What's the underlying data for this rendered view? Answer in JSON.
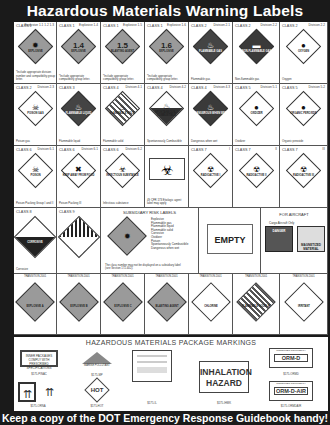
{
  "title": "Hazardous Materials Warning Labels",
  "footer": "Keep a copy of the DOT Emergency Response Guidebook handy!",
  "row1": [
    {
      "cls": "CLASS 1",
      "div": "Explosive 1.1 1.2 1.3",
      "num": "",
      "txt": "EXPLOSIVE",
      "sym": "✹",
      "style": "orange",
      "cap": "*Include appropriate division number and compatibility group letter."
    },
    {
      "cls": "CLASS 1",
      "div": "Explosive 1.4",
      "num": "1.4",
      "txt": "EXPLOSIVE",
      "sym": "",
      "style": "orange",
      "cap": "*Include appropriate compatibility group letter."
    },
    {
      "cls": "CLASS 1",
      "div": "Explosive 1.5",
      "num": "1.5",
      "txt": "BLASTING AGENT",
      "sym": "",
      "style": "orange",
      "cap": "*Include appropriate compatibility group letter."
    },
    {
      "cls": "CLASS 1",
      "div": "Explosive 1.6",
      "num": "1.6",
      "txt": "EXPLOSIVE",
      "sym": "",
      "style": "orange",
      "cap": "*Include appropriate compatibility group letter."
    },
    {
      "cls": "CLASS 2",
      "div": "Division 2.1",
      "num": "",
      "txt": "FLAMMABLE GAS",
      "sym": "♨",
      "style": "dark",
      "cap": "Flammable gas"
    },
    {
      "cls": "CLASS 2",
      "div": "Division 2.2",
      "num": "",
      "txt": "NON-FLAMMABLE GAS",
      "sym": "▬",
      "style": "darker",
      "cap": "Non-flammable gas"
    },
    {
      "cls": "CLASS 2",
      "div": "Division 2.2",
      "num": "",
      "txt": "OXYGEN",
      "sym": "●",
      "style": "white",
      "cap": "Oxygen"
    }
  ],
  "row2": [
    {
      "cls": "CLASS 2",
      "div": "Division 2.3",
      "num": "",
      "txt": "POISON GAS",
      "sym": "☠",
      "style": "white",
      "cap": "Poison gas"
    },
    {
      "cls": "CLASS 3",
      "div": "",
      "num": "",
      "txt": "FLAMMABLE LIQUID",
      "sym": "♨",
      "style": "dark",
      "cap": "Flammable liquid"
    },
    {
      "cls": "CLASS 4",
      "div": "Division 4.1",
      "num": "",
      "txt": "FLAMMABLE SOLID",
      "sym": "♨",
      "style": "stripe",
      "cap": "Flammable solid"
    },
    {
      "cls": "CLASS 4",
      "div": "Division 4.2",
      "num": "",
      "txt": "SPONTANEOUSLY COMBUSTIBLE",
      "sym": "♨",
      "style": "half",
      "cap": "Spontaneously Combustible"
    },
    {
      "cls": "CLASS 4",
      "div": "Division 4.3",
      "num": "",
      "txt": "DANGEROUS WHEN WET",
      "sym": "♨",
      "style": "darker",
      "cap": "Dangerous when wet"
    },
    {
      "cls": "CLASS 5",
      "div": "Division 5.1",
      "num": "",
      "txt": "OXIDIZER",
      "sym": "●",
      "style": "white",
      "cap": "Oxidizer"
    },
    {
      "cls": "CLASS 5",
      "div": "Division 5.2",
      "num": "",
      "txt": "ORGANIC PEROXIDE",
      "sym": "●",
      "style": "white",
      "cap": "Organic peroxide"
    }
  ],
  "row3": [
    {
      "cls": "CLASS 6",
      "div": "Division 6.1",
      "num": "",
      "txt": "POISON",
      "sym": "☠",
      "style": "white",
      "cap": "Poison Packing Group I and II"
    },
    {
      "cls": "CLASS 6",
      "div": "Division 6.1",
      "num": "",
      "txt": "KEEP AWAY FROM FOOD",
      "sym": "✖",
      "style": "white",
      "cap": "Poison Packing III"
    },
    {
      "cls": "CLASS 6",
      "div": "Division 6.2",
      "num": "",
      "txt": "INFECTIOUS SUBSTANCE",
      "sym": "☣",
      "style": "white",
      "cap": "Infectious substance"
    },
    {
      "cls": "",
      "div": "",
      "num": "",
      "txt": "",
      "sym": "☣",
      "style": "bio",
      "cap": "49 CFR 173 Etiologic agent label may apply"
    },
    {
      "cls": "CLASS 7",
      "div": "I",
      "num": "",
      "txt": "RADIOACTIVE I",
      "sym": "☢",
      "style": "white",
      "cap": ""
    },
    {
      "cls": "CLASS 7",
      "div": "II",
      "num": "",
      "txt": "RADIOACTIVE II",
      "sym": "☢",
      "style": "white",
      "cap": ""
    },
    {
      "cls": "CLASS 7",
      "div": "III",
      "num": "",
      "txt": "RADIOACTIVE III",
      "sym": "☢",
      "style": "white",
      "cap": ""
    }
  ],
  "row4": {
    "class8": {
      "cls": "CLASS 8",
      "txt": "CORROSIVE",
      "cap": "Corrosive"
    },
    "class9": {
      "cls": "CLASS 9",
      "cap": ""
    },
    "subsidiary": {
      "header": "SUBSIDIARY RISK LABELS",
      "items": [
        "Explosive",
        "Flammable gas",
        "Flammable liquid",
        "Flammable solid",
        "Corrosive",
        "Oxidizer",
        "Poison",
        "Spontaneously Combustible",
        "Dangerous when wet"
      ],
      "note": "The class number may not be displayed on a subsidiary label (see Section 172.402)."
    },
    "empty": {
      "label": "EMPTY"
    },
    "aircraft": {
      "header": "FOR AIRCRAFT",
      "sub": "Cargo Aircraft Only",
      "label1": "DANGER",
      "label2": "MAGNETIZED MATERIAL"
    }
  },
  "row5": [
    {
      "hdr": "TRANSITION 2001",
      "txt": "EXPLOSIVE A",
      "style": "orange"
    },
    {
      "hdr": "TRANSITION 2001",
      "txt": "EXPLOSIVE B",
      "style": "orange"
    },
    {
      "hdr": "TRANSITION 2001",
      "txt": "EXPLOSIVE C",
      "style": "orange"
    },
    {
      "hdr": "TRANSITION 2001",
      "txt": "BLASTING AGENT",
      "style": "orange"
    },
    {
      "hdr": "TRANSITION 2001",
      "txt": "CHLORINE",
      "style": "white"
    },
    {
      "hdr": "TRANSITION 2001",
      "txt": "FLAMMABLE SOLID W",
      "style": "stripe"
    },
    {
      "hdr": "TRANSITION 2001",
      "txt": "IRRITANT",
      "style": "white"
    }
  ],
  "packages": {
    "title": "HAZARDOUS MATERIALS PACKAGE MARKINGS",
    "inner_pkg": {
      "text": "INNER PACKAGES COMPLY WITH PRESCRIBED SPECIFICATIONS",
      "cap": "$175-PINAC"
    },
    "arrows": {
      "cap": "$175-ORNA"
    },
    "marine": {
      "text": "MARINE POLLUTANT",
      "cap": "$175-MP"
    },
    "hot": {
      "text": "HOT",
      "cap": "$175-HOT"
    },
    "letter": {
      "cap": "$175-IL"
    },
    "inhalation": {
      "line1": "INHALATION",
      "line2": "HAZARD",
      "cap": "$175-IHMK"
    },
    "ormd": {
      "hdr": "CONSUMER COMMODITY",
      "text": "ORM-D",
      "cap": "$175-ORMD"
    },
    "ormdair": {
      "hdr": "CONSUMER COMMODITY",
      "text": "ORM-D-AIR",
      "cap": "$175-ORMDAIR"
    }
  }
}
